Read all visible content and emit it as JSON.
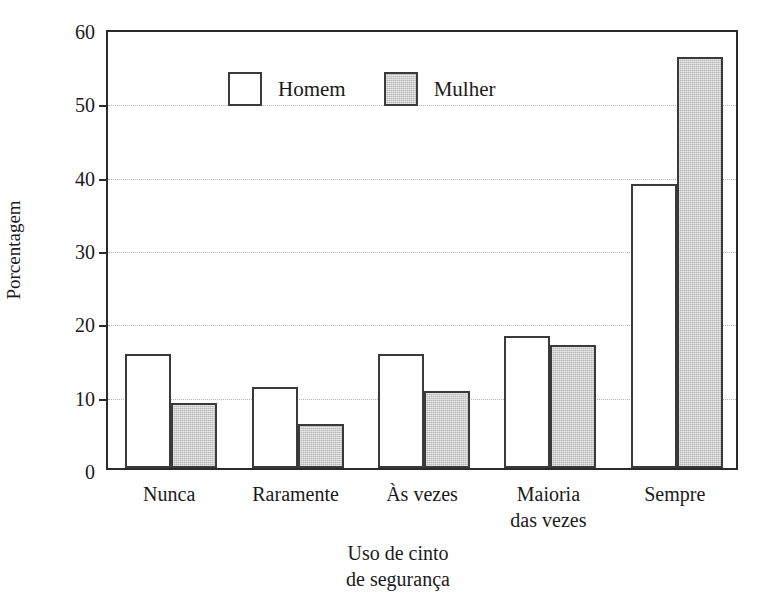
{
  "chart_data": {
    "type": "bar",
    "title": "",
    "xlabel": "Uso de cinto\nde segurança",
    "ylabel": "Porcentagem",
    "categories": [
      "Nunca",
      "Raramente",
      "Às vezes",
      "Maioria\ndas vezes",
      "Sempre"
    ],
    "series": [
      {
        "name": "Homem",
        "values": [
          15.6,
          11.0,
          15.6,
          18.0,
          38.7
        ],
        "fill": "#ffffff",
        "edge": "#3a3a3a"
      },
      {
        "name": "Mulher",
        "values": [
          8.8,
          6.0,
          10.5,
          16.8,
          56.0
        ],
        "fill": "#c9c9c9",
        "edge": "#3a3a3a"
      }
    ],
    "ylim": [
      0,
      60
    ],
    "yticks": [
      0,
      10,
      20,
      30,
      40,
      50,
      60
    ],
    "ytick_labels": [
      "0",
      "10",
      "20",
      "30",
      "40",
      "50",
      "60"
    ],
    "grid": true,
    "grid_axis": "y",
    "grid_style": "dotted",
    "legend_position": "top-left-inside",
    "legend_entries": [
      "Homem",
      "Mulher"
    ],
    "bar_group_count": 5,
    "bars_per_group": 2
  },
  "axes": {
    "y_title": "Porcentagem",
    "x_title_line1": "Uso de cinto",
    "x_title_line2": "de segurança"
  },
  "legend": {
    "items": [
      {
        "label": "Homem"
      },
      {
        "label": "Mulher"
      }
    ]
  },
  "colors": {
    "frame": "#2b2b2b",
    "text": "#1a1a1a",
    "grid": "#b3b3b3",
    "bar_homem_fill": "#ffffff",
    "bar_mulher_fill": "#c9c9c9",
    "bar_edge": "#3a3a3a",
    "background": "#ffffff"
  }
}
